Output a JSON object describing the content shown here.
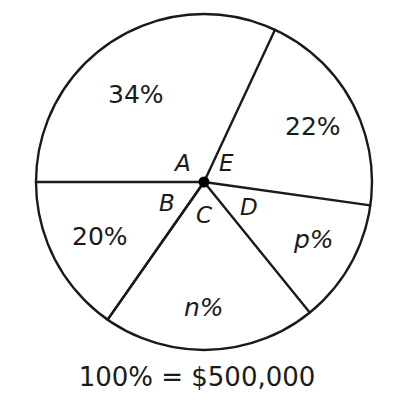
{
  "chart_data": {
    "type": "pie",
    "title": "",
    "subtitle": "",
    "xlabel": "",
    "ylabel": "",
    "legend_position": "none",
    "grid": false,
    "total_label": "100% = $500,000",
    "total_value": 500000,
    "units": "percent",
    "categories": [
      "34%",
      "22%",
      "p%",
      "n%",
      "20%"
    ],
    "values": [
      34,
      22,
      12,
      17,
      15
    ],
    "slices": [
      {
        "label": "34%",
        "value": 34,
        "angle_label": "A",
        "start_angle_deg": 65,
        "end_angle_deg": 180,
        "label_x": 108,
        "label_y": 82
      },
      {
        "label": "22%",
        "value": 22,
        "angle_label": "E",
        "start_angle_deg": -8,
        "end_angle_deg": 65,
        "label_x": 285,
        "label_y": 114
      },
      {
        "label": "p%",
        "value": null,
        "angle_label": "D",
        "start_angle_deg": -51,
        "end_angle_deg": -8,
        "label_x": 294,
        "label_y": 227
      },
      {
        "label": "n%",
        "value": null,
        "angle_label": "C",
        "start_angle_deg": -125,
        "end_angle_deg": -51,
        "label_x": 184,
        "label_y": 295
      },
      {
        "label": "20%",
        "value": 20,
        "angle_label": "B",
        "start_angle_deg": 180,
        "end_angle_deg": 235,
        "label_x": 72,
        "label_y": 224
      }
    ],
    "angle_labels": [
      {
        "name": "A",
        "x": 175,
        "y": 152
      },
      {
        "name": "B",
        "x": 159,
        "y": 192
      },
      {
        "name": "C",
        "x": 196,
        "y": 204
      },
      {
        "name": "D",
        "x": 240,
        "y": 196
      },
      {
        "name": "E",
        "x": 219,
        "y": 152
      }
    ],
    "geometry": {
      "center_x": 204,
      "center_y": 182,
      "radius": 168
    },
    "colors": {
      "stroke": "#1a1a1a",
      "fill": "#ffffff",
      "text": "#1a1a1a",
      "center_dot": "#000000"
    }
  },
  "figure": {
    "name": "pie-chart-budget-distribution",
    "caption": "100% = $500,000"
  }
}
